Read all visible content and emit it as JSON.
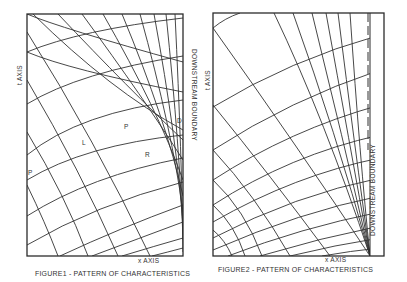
{
  "figures": [
    {
      "id": "figure1",
      "caption": "FIGURE1 - PATTERN OF CHARACTERISTICS",
      "y_axis_label": "t AXIS",
      "x_axis_label": "x AXIS",
      "boundary_label": "DOWNSTREAM BOUNDARY",
      "point_labels": [
        "P",
        "L",
        "P",
        "R",
        "D"
      ]
    },
    {
      "id": "figure2",
      "caption": "FIGURE2 - PATTERN OF CHARACTERISTICS",
      "y_axis_label": "t AXIS",
      "x_axis_label": "x AXIS",
      "boundary_label": "DOWNSTREAM BOUNDARY"
    }
  ],
  "colors": {
    "ink": "#333333",
    "background": "#ffffff"
  }
}
